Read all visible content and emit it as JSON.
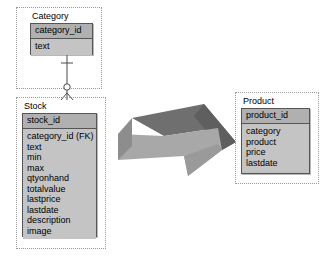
{
  "diagram": {
    "background_color": "#ffffff",
    "entity_fill": "#c4c4c4",
    "entity_key_fill": "#b0b0b0",
    "entity_border_color": "#555555",
    "selection_border_color": "#9a9a9a"
  },
  "entities": {
    "category": {
      "caption": "Category",
      "key_field": "category_id",
      "fields": [
        "text"
      ]
    },
    "stock": {
      "caption": "Stock",
      "key_field": "stock_id",
      "fields": [
        "category_id (FK)",
        "text",
        "min",
        "max",
        "qtyonhand",
        "totalvalue",
        "lastprice",
        "lastdate",
        "description",
        "image"
      ]
    },
    "product": {
      "caption": "Product",
      "key_field": "product_id",
      "fields": [
        "category",
        "product",
        "price",
        "lastdate"
      ]
    }
  },
  "relationship": {
    "name": "category-to-stock",
    "from": "Category",
    "to": "Stock",
    "from_cardinality": "one",
    "to_cardinality": "zero-or-many",
    "notation": "crows-foot"
  },
  "transform_arrow": {
    "name": "transform-arrow",
    "direction": "right",
    "style": "3d-block",
    "face_color": "#a8a8a8",
    "bevel_color": "#6f6f6f",
    "shade_color": "#8d8d8d"
  }
}
